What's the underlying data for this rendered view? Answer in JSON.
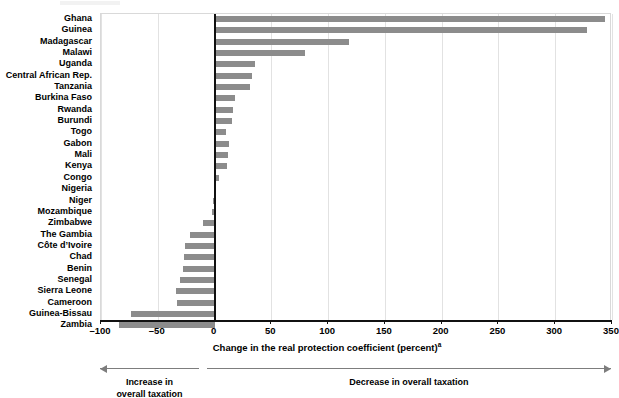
{
  "chart_data": {
    "type": "bar",
    "orientation": "horizontal",
    "title": "",
    "xlabel": "Change in the real protection coefficient (percent)",
    "xlabel_superscript": "a",
    "ylabel": "",
    "xlim": [
      -100,
      350
    ],
    "grid": true,
    "legend": "none",
    "xticks": [
      -100,
      -50,
      0,
      50,
      100,
      150,
      200,
      250,
      300,
      350
    ],
    "xticklabels": [
      "–100",
      "–50",
      "0",
      "50",
      "100",
      "150",
      "200",
      "250",
      "300",
      "350"
    ],
    "bar_color": "#8c8c8c",
    "categories": [
      "Ghana",
      "Guinea",
      "Madagascar",
      "Malawi",
      "Uganda",
      "Central African Rep.",
      "Tanzania",
      "Burkina Faso",
      "Rwanda",
      "Burundi",
      "Togo",
      "Gabon",
      "Mali",
      "Kenya",
      "Congo",
      "Nigeria",
      "Niger",
      "Mozambique",
      "Zimbabwe",
      "The Gambia",
      "Côte d’Ivoire",
      "Chad",
      "Benin",
      "Senegal",
      "Sierra Leone",
      "Cameroon",
      "Guinea-Bissau",
      "Zambia"
    ],
    "values": [
      344,
      328,
      118,
      80,
      36,
      33,
      31,
      18,
      16,
      15,
      10,
      13,
      12,
      11,
      4,
      0,
      -1,
      -2,
      -10,
      -22,
      -26,
      -27,
      -28,
      -30,
      -34,
      -33,
      -74,
      -84
    ],
    "annotations": [
      {
        "label": "Increase in\noverall taxation",
        "range": [
          -100,
          -13
        ],
        "arrow": "left"
      },
      {
        "label": "Decrease in overall taxation",
        "range": [
          -6,
          350
        ],
        "arrow": "right"
      }
    ]
  },
  "annotation_left": {
    "line1": "Increase in",
    "line2": "overall taxation"
  },
  "annotation_right": {
    "line1": "Decrease in overall taxation"
  }
}
